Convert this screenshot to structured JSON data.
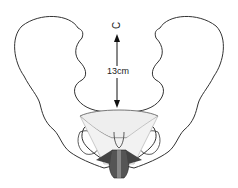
{
  "diagram": {
    "measurement_label": "13cm",
    "top_marker": "C",
    "colors": {
      "outline": "#333333",
      "pelvic_inlet_fill": "#eeeeee",
      "muscle_fill": "#555555"
    }
  }
}
